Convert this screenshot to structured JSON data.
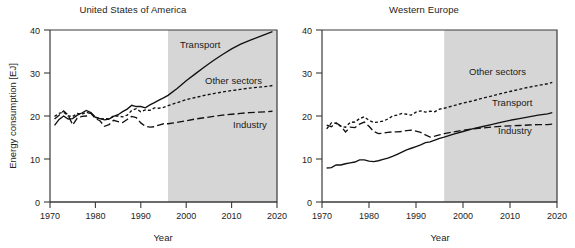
{
  "figure": {
    "ylabel": "Energy consumption [EJ]",
    "xlabel_usa": "Year",
    "xlabel_weu": "Year",
    "projection_start_year": 1996,
    "shade_color": "#d6d6d6",
    "line_color": "#111111"
  },
  "panels": [
    {
      "id": "usa",
      "title": "United States of America"
    },
    {
      "id": "weu",
      "title": "Western Europe"
    }
  ],
  "yticks": [
    "0",
    "10",
    "20",
    "30",
    "40"
  ],
  "xticks": [
    "1970",
    "1980",
    "1990",
    "2000",
    "2010",
    "2020"
  ],
  "series_labels": {
    "usa_transport": "Transport",
    "usa_other": "Other sectors",
    "usa_industry": "Industry",
    "weu_other": "Other sectors",
    "weu_transport": "Transport",
    "weu_industry": "Industry"
  },
  "chart_data": {
    "type": "line",
    "xlabel": "Year",
    "ylabel": "Energy consumption [EJ]",
    "xlim": [
      1970,
      2020
    ],
    "ylim": [
      0,
      40
    ],
    "xticks": [
      1970,
      1980,
      1990,
      2000,
      2010,
      2020
    ],
    "yticks": [
      0,
      10,
      20,
      30,
      40
    ],
    "grid": false,
    "legend": "inline-annotations",
    "annotations": [
      {
        "panel": "United States of America",
        "text": "Transport",
        "style": "solid"
      },
      {
        "panel": "United States of America",
        "text": "Other sectors",
        "style": "dotted"
      },
      {
        "panel": "United States of America",
        "text": "Industry",
        "style": "dashed"
      },
      {
        "panel": "Western Europe",
        "text": "Other sectors",
        "style": "dotted"
      },
      {
        "panel": "Western Europe",
        "text": "Transport",
        "style": "solid"
      },
      {
        "panel": "Western Europe",
        "text": "Industry",
        "style": "dashed"
      }
    ],
    "shaded_projection_region": {
      "from": 1996,
      "to": 2020,
      "color": "#d6d6d6"
    },
    "panels": [
      {
        "name": "United States of America",
        "x": [
          1971,
          1972,
          1973,
          1974,
          1975,
          1976,
          1977,
          1978,
          1979,
          1980,
          1981,
          1982,
          1983,
          1984,
          1985,
          1986,
          1987,
          1988,
          1989,
          1990,
          1991,
          1992,
          1993,
          1994,
          1995,
          1996,
          1998,
          2000,
          2002,
          2004,
          2006,
          2008,
          2010,
          2012,
          2014,
          2016,
          2018,
          2019
        ],
        "series": [
          {
            "name": "Transport",
            "style": "solid",
            "values": [
              17.8,
              19.2,
              20.0,
              19.3,
              19.4,
              20.2,
              20.7,
              21.3,
              20.8,
              19.7,
              19.4,
              19.1,
              19.3,
              19.9,
              20.3,
              21.0,
              21.6,
              22.5,
              22.2,
              22.2,
              21.9,
              22.6,
              23.1,
              23.7,
              24.2,
              24.8,
              26.4,
              28.2,
              29.8,
              31.4,
              32.9,
              34.3,
              35.6,
              36.7,
              37.6,
              38.4,
              39.2,
              39.6
            ]
          },
          {
            "name": "Other sectors",
            "style": "dotted",
            "values": [
              19.9,
              20.6,
              20.9,
              20.0,
              19.9,
              20.6,
              20.4,
              20.9,
              20.5,
              19.8,
              19.3,
              19.4,
              19.3,
              20.0,
              20.0,
              19.8,
              20.2,
              21.3,
              21.7,
              21.0,
              21.4,
              21.3,
              21.9,
              21.8,
              22.0,
              22.4,
              23.1,
              23.8,
              24.3,
              24.8,
              25.2,
              25.6,
              25.9,
              26.2,
              26.5,
              26.7,
              26.9,
              27.1
            ]
          },
          {
            "name": "Industry",
            "style": "dashed",
            "values": [
              19.3,
              20.2,
              21.2,
              20.2,
              17.9,
              19.5,
              19.9,
              20.0,
              20.7,
              19.4,
              18.9,
              17.6,
              18.0,
              19.0,
              18.7,
              18.5,
              19.2,
              19.9,
              19.6,
              18.4,
              17.6,
              17.4,
              17.5,
              17.9,
              18.2,
              18.2,
              18.5,
              18.9,
              19.3,
              19.6,
              19.9,
              20.2,
              20.4,
              20.6,
              20.8,
              20.9,
              21.0,
              21.1
            ]
          }
        ]
      },
      {
        "name": "Western Europe",
        "x": [
          1971,
          1972,
          1973,
          1974,
          1975,
          1976,
          1977,
          1978,
          1979,
          1980,
          1981,
          1982,
          1983,
          1984,
          1985,
          1986,
          1987,
          1988,
          1989,
          1990,
          1991,
          1992,
          1993,
          1994,
          1995,
          1996,
          1998,
          2000,
          2002,
          2004,
          2006,
          2008,
          2010,
          2012,
          2014,
          2016,
          2018,
          2019
        ],
        "series": [
          {
            "name": "Other sectors",
            "style": "dotted",
            "values": [
              17.0,
              18.4,
              18.3,
              17.6,
              17.4,
              18.5,
              18.6,
              19.4,
              19.8,
              19.0,
              18.5,
              18.6,
              18.8,
              19.3,
              20.0,
              20.2,
              20.6,
              20.4,
              20.2,
              20.9,
              21.2,
              20.9,
              21.1,
              21.0,
              21.6,
              21.8,
              22.4,
              23.0,
              23.5,
              24.1,
              24.6,
              25.2,
              25.7,
              26.2,
              26.7,
              27.1,
              27.5,
              27.8
            ]
          },
          {
            "name": "Industry",
            "style": "dashed",
            "values": [
              17.9,
              17.5,
              18.4,
              17.7,
              16.3,
              17.4,
              17.3,
              18.1,
              18.6,
              17.6,
              16.4,
              15.9,
              16.0,
              16.2,
              16.3,
              16.3,
              16.4,
              16.6,
              16.7,
              16.5,
              16.2,
              15.6,
              15.1,
              15.3,
              15.6,
              15.9,
              16.3,
              16.7,
              17.0,
              17.2,
              17.4,
              17.6,
              17.7,
              17.8,
              17.9,
              18.0,
              18.0,
              18.1
            ]
          },
          {
            "name": "Transport",
            "style": "solid",
            "values": [
              7.9,
              8.0,
              8.6,
              8.6,
              8.9,
              9.1,
              9.3,
              9.8,
              9.8,
              9.5,
              9.4,
              9.6,
              9.9,
              10.2,
              10.6,
              11.1,
              11.6,
              12.1,
              12.5,
              12.9,
              13.3,
              13.8,
              14.0,
              14.4,
              14.8,
              15.1,
              15.8,
              16.4,
              17.0,
              17.5,
              18.0,
              18.5,
              19.0,
              19.4,
              19.8,
              20.2,
              20.5,
              20.8
            ]
          }
        ]
      }
    ]
  }
}
